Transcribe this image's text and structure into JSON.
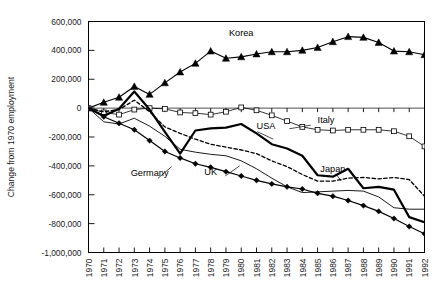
{
  "chart_data": {
    "type": "line",
    "title": "",
    "xlabel": "",
    "ylabel": "Change from 1970 employment",
    "x": [
      1970,
      1971,
      1972,
      1973,
      1974,
      1975,
      1976,
      1977,
      1978,
      1979,
      1980,
      1981,
      1982,
      1983,
      1984,
      1985,
      1986,
      1987,
      1988,
      1989,
      1990,
      1991,
      1992
    ],
    "xtick_labels": [
      "1970",
      "1971",
      "1972",
      "1973",
      "1974",
      "1975",
      "1976",
      "1977",
      "1978",
      "1979",
      "1980",
      "1981",
      "1982",
      "1983",
      "1984",
      "1985",
      "1986",
      "1987",
      "1988",
      "1989",
      "1990",
      "1991",
      "1992"
    ],
    "ytick_labels": [
      "600,000",
      "400,000",
      "200,000",
      "0",
      "-200,000",
      "-400,000",
      "-600,000",
      "-800,000",
      "-1,000,000"
    ],
    "ytick_values": [
      600000,
      400000,
      200000,
      0,
      -200000,
      -400000,
      -600000,
      -800000,
      -1000000
    ],
    "ylim": [
      -1000000,
      600000
    ],
    "xlim": [
      1970,
      1992
    ],
    "grid": false,
    "legend_position": "inline-annotations",
    "series": [
      {
        "name": "Korea",
        "marker": "filled-triangle",
        "line_style": "solid",
        "line_width": 1.1,
        "label_x": 1980,
        "label_y": 500000,
        "values": [
          0,
          40000,
          75000,
          150000,
          95000,
          175000,
          250000,
          310000,
          395000,
          345000,
          355000,
          375000,
          390000,
          390000,
          400000,
          420000,
          460000,
          495000,
          490000,
          455000,
          395000,
          390000,
          370000
        ]
      },
      {
        "name": "Italy",
        "marker": "open-square",
        "line_style": "solid",
        "line_width": 0.8,
        "label_x": 1985,
        "label_y": -105000,
        "values": [
          0,
          -30000,
          -45000,
          -10000,
          0,
          -5000,
          -30000,
          -35000,
          -45000,
          -25000,
          5000,
          -15000,
          -50000,
          -90000,
          -130000,
          -150000,
          -155000,
          -150000,
          -150000,
          -150000,
          -160000,
          -195000,
          -265000
        ]
      },
      {
        "name": "USA",
        "marker": "none",
        "line_style": "solid",
        "line_width": 2.2,
        "label_x": 1981,
        "label_y": -145000,
        "values": [
          0,
          -55000,
          -5000,
          115000,
          -10000,
          -165000,
          -315000,
          -155000,
          -140000,
          -135000,
          -110000,
          -175000,
          -250000,
          -280000,
          -330000,
          -465000,
          -475000,
          -420000,
          -555000,
          -545000,
          -565000,
          -755000,
          -790000
        ]
      },
      {
        "name": "Japan",
        "marker": "none",
        "line_style": "dashed",
        "line_width": 1.3,
        "label_x": 1986,
        "label_y": -440000,
        "values": [
          0,
          -25000,
          -10000,
          55000,
          -25000,
          -130000,
          -175000,
          -215000,
          -250000,
          -270000,
          -290000,
          -315000,
          -365000,
          -405000,
          -460000,
          -505000,
          -505000,
          -485000,
          -480000,
          -490000,
          -480000,
          -495000,
          -610000
        ]
      },
      {
        "name": "UK",
        "marker": "none",
        "line_style": "solid",
        "line_width": 0.9,
        "label_x": 1978,
        "label_y": -465000,
        "values": [
          0,
          -95000,
          -110000,
          -70000,
          -125000,
          -195000,
          -285000,
          -305000,
          -320000,
          -330000,
          -365000,
          -420000,
          -485000,
          -545000,
          -585000,
          -580000,
          -575000,
          -570000,
          -575000,
          -615000,
          -690000,
          -700000,
          -700000
        ]
      },
      {
        "name": "Germany",
        "marker": "filled-diamond",
        "line_style": "solid",
        "line_width": 1.2,
        "label_x": 1974,
        "label_y": -470000,
        "values": [
          0,
          -60000,
          -105000,
          -150000,
          -225000,
          -300000,
          -345000,
          -385000,
          -410000,
          -440000,
          -470000,
          -500000,
          -525000,
          -545000,
          -560000,
          -590000,
          -610000,
          -640000,
          -675000,
          -715000,
          -765000,
          -820000,
          -870000
        ]
      }
    ]
  }
}
